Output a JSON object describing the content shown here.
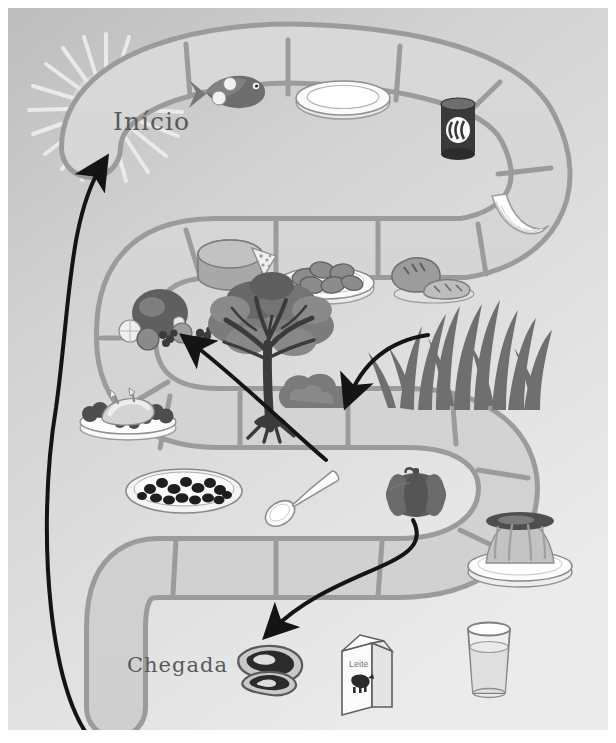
{
  "page": {
    "kind": "board-game-illustration",
    "theme": "food-chain-board-game",
    "language": "pt-BR",
    "background_color": "#d5d5d5",
    "frame_color": "#ffffff",
    "track_fill": "#d2d2d2",
    "track_outline": "#8e8e8e",
    "cell_divider_color": "#9a9a9a",
    "arrow_color": "#1a1a1a",
    "text_color": "#5a5a5a"
  },
  "labels": {
    "start": "Início",
    "finish": "Chegada"
  },
  "decorations": {
    "sun": {
      "name": "sun-with-rays",
      "rays": 20,
      "color": "#e8e8e8"
    },
    "tree": {
      "name": "tree",
      "color": "#7c7c7c"
    },
    "bush": {
      "name": "bush",
      "color": "#828282"
    },
    "grass": {
      "name": "grass-tuft",
      "color": "#6f6f6f"
    }
  },
  "milk_carton": {
    "label": "Leite"
  },
  "arrows": [
    {
      "name": "arrow-to-inicio",
      "from": "bottom-left",
      "to": "Início",
      "direction": "up"
    },
    {
      "name": "arrow-to-potatoes",
      "from": "canned-food",
      "to": "potatoes-plate",
      "direction": "down-left"
    },
    {
      "name": "arrow-to-fruits",
      "from": "tree",
      "to": "fruits-cell",
      "direction": "up-left"
    },
    {
      "name": "arrow-to-meat",
      "from": "pumpkin",
      "to": "meat-cell",
      "direction": "down-left"
    }
  ],
  "cells": [
    {
      "index": 1,
      "name": "cell-inicio",
      "icon": "start-label",
      "label": "Início",
      "row": "top"
    },
    {
      "index": 2,
      "name": "cell-fish",
      "icon": "fish-icon",
      "label": "peixe",
      "row": "top"
    },
    {
      "index": 3,
      "name": "cell-plate",
      "icon": "plate-icon",
      "label": "prato",
      "row": "top"
    },
    {
      "index": 4,
      "name": "cell-can",
      "icon": "can-icon",
      "label": "lata",
      "row": "top-right-curve"
    },
    {
      "index": 5,
      "name": "cell-banana",
      "icon": "banana-icon",
      "label": "banana",
      "row": "top-right-curve"
    },
    {
      "index": 6,
      "name": "cell-bread",
      "icon": "bread-icon",
      "label": "pão",
      "row": "middle"
    },
    {
      "index": 7,
      "name": "cell-potatoes",
      "icon": "potatoes-icon",
      "label": "batatas",
      "row": "middle"
    },
    {
      "index": 8,
      "name": "cell-cheese",
      "icon": "cheese-icon",
      "label": "queijo",
      "row": "middle"
    },
    {
      "index": 9,
      "name": "cell-fruits",
      "icon": "fruits-icon",
      "label": "frutas",
      "row": "middle-left-curve"
    },
    {
      "index": 10,
      "name": "cell-chicken",
      "icon": "roast-chicken-icon",
      "label": "frango",
      "row": "middle-left-curve"
    },
    {
      "index": 11,
      "name": "cell-pizza",
      "icon": "pizza-icon",
      "label": "pizza",
      "row": "lower"
    },
    {
      "index": 12,
      "name": "cell-spoon",
      "icon": "spoon-icon",
      "label": "colher",
      "row": "lower"
    },
    {
      "index": 13,
      "name": "cell-pumpkin",
      "icon": "pumpkin-icon",
      "label": "abóbora",
      "row": "lower"
    },
    {
      "index": 14,
      "name": "cell-pudding",
      "icon": "pudding-icon",
      "label": "pudim",
      "row": "lower-right-curve"
    },
    {
      "index": 15,
      "name": "cell-glass",
      "icon": "glass-of-water-icon",
      "label": "copo",
      "row": "bottom"
    },
    {
      "index": 16,
      "name": "cell-milk",
      "icon": "milk-carton-icon",
      "label": "Leite",
      "row": "bottom"
    },
    {
      "index": 17,
      "name": "cell-meat",
      "icon": "meat-icon",
      "label": "carne",
      "row": "bottom"
    },
    {
      "index": 18,
      "name": "cell-chegada",
      "icon": "finish-label",
      "label": "Chegada",
      "row": "bottom"
    }
  ]
}
